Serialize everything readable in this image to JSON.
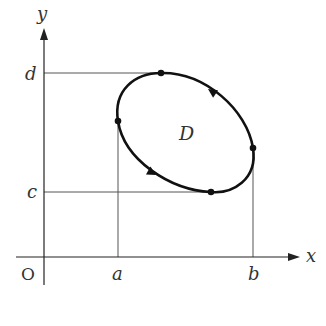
{
  "diagram": {
    "axes": {
      "x_label": "x",
      "y_label": "y",
      "origin_label": "O"
    },
    "ticks": {
      "x": [
        {
          "label": "a"
        },
        {
          "label": "b"
        }
      ],
      "y": [
        {
          "label": "d"
        },
        {
          "label": "c"
        }
      ]
    },
    "region_label": "D",
    "curve": {
      "type": "closed curve (ellipse-like)",
      "orientation": "counterclockwise",
      "marked_points": [
        "top (y=d)",
        "left (x=a)",
        "bottom (y=c)",
        "right (x=b)"
      ],
      "arrows": 2
    },
    "colors": {
      "curve": "#111111",
      "guide_lines": "#444444",
      "text": "#333333"
    }
  }
}
